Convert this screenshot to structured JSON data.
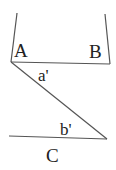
{
  "diagram": {
    "type": "geometry-angles",
    "labels": {
      "A": "A",
      "B": "B",
      "a_prime": "a'",
      "b_prime": "b'",
      "C": "C"
    },
    "colors": {
      "line": "#555555",
      "text": "#222222",
      "background": "#ffffff"
    }
  }
}
